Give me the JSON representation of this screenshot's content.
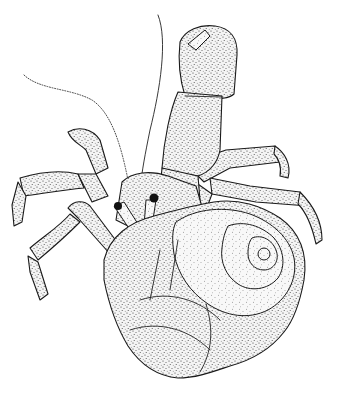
{
  "illustration": {
    "subject": "hermit crab in spiral shell",
    "style": "stipple ink drawing",
    "colors": {
      "background": "#ffffff",
      "ink": "#1a1a1a"
    },
    "parts": {
      "antennae": [
        "left-antenna",
        "right-antenna"
      ],
      "claw": "large-raised-claw",
      "legs": [
        "left-upper-leg",
        "left-lower-leg",
        "right-upper-leg",
        "right-lower-leg"
      ],
      "eyes": [
        "left-eye",
        "right-eye"
      ],
      "shell": "spiral-shell"
    }
  }
}
